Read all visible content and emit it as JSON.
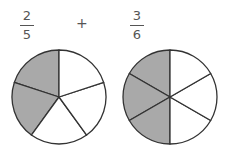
{
  "expression": {
    "left": {
      "numerator": "2",
      "denominator": "5"
    },
    "operator": "+",
    "right": {
      "numerator": "3",
      "denominator": "6"
    }
  },
  "pies": [
    {
      "name": "fifths",
      "slices": 5,
      "shaded": 2,
      "center": [
        59,
        97
      ],
      "radius": 47
    },
    {
      "name": "sixths",
      "slices": 6,
      "shaded": 3,
      "center": [
        170,
        97
      ],
      "radius": 47
    }
  ],
  "colors": {
    "shade": "#a9a9a9",
    "line": "#333333",
    "empty": "#ffffff"
  }
}
